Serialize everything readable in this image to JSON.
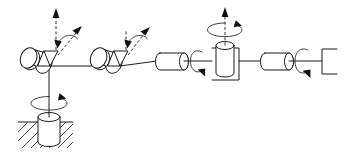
{
  "figure": {
    "domain": "Diagram",
    "background_color": "#ffffff",
    "line_color": "#1a1a1a",
    "width": 349,
    "height": 161
  },
  "diagram_data": {
    "type": "kinematic-schematic",
    "description": "Six degree-of-freedom serial manipulator drawn as a skeleton diagram with cylindrical joint symbols, dashed rotation axes, curved rotation arrows, a hatched fixed ground base and a bracket end effector.",
    "degrees_of_freedom": 6,
    "ground": {
      "name": "fixed-ground",
      "hatch_direction": "up-right",
      "hatch_line_count": 9,
      "surface_y": 122
    },
    "joints": [
      {
        "index": 1,
        "name": "base-waist-revolute",
        "symbol": "vertical-cylinder",
        "axis": "vertical",
        "axis_style": "solid",
        "rotation_arrow": "ellipse-cw",
        "cx": 49,
        "cy": 132
      },
      {
        "index": 2,
        "name": "shoulder-revolute",
        "symbol": "tilted-cylinder-with-flange",
        "axis": "tilted-up-right",
        "axis_style": "dashed",
        "rotation_arrow": "small-curved-cw",
        "cx": 30,
        "cy": 59
      },
      {
        "index": 3,
        "name": "elbow-revolute",
        "symbol": "tilted-cylinder-with-flange",
        "axis": "tilted-up-right",
        "axis_style": "dashed",
        "rotation_arrow": "small-curved-cw",
        "cx": 100,
        "cy": 59
      },
      {
        "index": 4,
        "name": "forearm-roll-revolute",
        "symbol": "horizontal-cylinder",
        "axis": "horizontal",
        "axis_style": "solid",
        "rotation_arrow": "c-shaped-roll",
        "cx": 172,
        "cy": 61
      },
      {
        "index": 5,
        "name": "wrist-pitch-revolute",
        "symbol": "vertical-cylinder-in-yoke",
        "axis": "vertical",
        "axis_style": "dashed",
        "rotation_arrow": "ellipse-cw",
        "cx": 226,
        "cy": 61
      },
      {
        "index": 6,
        "name": "tool-roll-revolute",
        "symbol": "horizontal-cylinder",
        "axis": "horizontal",
        "axis_style": "solid",
        "rotation_arrow": "c-shaped-roll",
        "cx": 277,
        "cy": 61
      }
    ],
    "links": [
      {
        "name": "base-column-link",
        "from": "fixed-ground",
        "to": "shoulder-revolute",
        "orientation": "vertical"
      },
      {
        "name": "upper-arm-link",
        "from": "shoulder-revolute",
        "to": "elbow-revolute",
        "orientation": "horizontal"
      },
      {
        "name": "forearm-link",
        "from": "elbow-revolute",
        "to": "forearm-roll-revolute",
        "orientation": "horizontal"
      },
      {
        "name": "wrist-link",
        "from": "forearm-roll-revolute",
        "to": "wrist-pitch-revolute",
        "orientation": "horizontal"
      },
      {
        "name": "tool-link",
        "from": "wrist-pitch-revolute",
        "to": "tool-roll-revolute",
        "orientation": "horizontal"
      },
      {
        "name": "end-effector-link",
        "from": "tool-roll-revolute",
        "to": "end-effector",
        "orientation": "horizontal"
      }
    ],
    "end_effector": {
      "name": "end-effector-bracket",
      "symbol": "open-bracket",
      "x": 322,
      "y": 61
    },
    "labels": []
  }
}
